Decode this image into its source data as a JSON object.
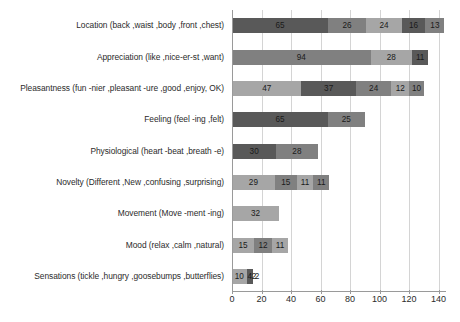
{
  "chart_data": {
    "type": "bar",
    "orientation": "horizontal",
    "stacked": true,
    "title": "",
    "xlabel": "",
    "ylabel": "",
    "xlim": [
      0,
      145
    ],
    "xticks": [
      0,
      20,
      40,
      60,
      80,
      100,
      120,
      140
    ],
    "xtick_labels": [
      "0",
      "20",
      "40",
      "60",
      "80",
      "100",
      "120",
      "140"
    ],
    "grid": true,
    "legend": "none",
    "categories": [
      "Location (back ,waist ,body ,front ,chest)",
      "Appreciation (like ,nice-er-st ,want)",
      "Pleasantness (fun -nier ,pleasant -ure ,good ,enjoy, OK)",
      "Feeling (feel -ing ,felt)",
      "Physiological (heart -beat ,breath -e)",
      "Novelty (Different ,New ,confusing ,surprising)",
      "Movement (Move -ment -ing)",
      "Mood (relax ,calm ,natural)",
      "Sensations (tickle ,hungry ,goosebumps ,butterflies)"
    ],
    "stacks": [
      [
        65,
        26,
        24,
        16,
        13
      ],
      [
        94,
        28,
        11
      ],
      [
        47,
        37,
        24,
        12,
        10
      ],
      [
        65,
        25
      ],
      [
        30,
        28
      ],
      [
        29,
        15,
        11,
        11
      ],
      [
        32
      ],
      [
        15,
        12,
        11
      ],
      [
        10,
        4,
        2,
        2
      ]
    ],
    "totals": [
      144,
      133,
      130,
      90,
      58,
      66,
      32,
      38,
      18
    ],
    "segment_colors": [
      [
        "#595959",
        "#808080",
        "#a6a6a6",
        "#595959",
        "#808080"
      ],
      [
        "#808080",
        "#a6a6a6",
        "#595959"
      ],
      [
        "#a6a6a6",
        "#595959",
        "#808080",
        "#a6a6a6",
        "#808080"
      ],
      [
        "#595959",
        "#808080"
      ],
      [
        "#595959",
        "#808080"
      ],
      [
        "#a6a6a6",
        "#808080",
        "#a6a6a6",
        "#808080"
      ],
      [
        "#a6a6a6"
      ],
      [
        "#a6a6a6",
        "#808080",
        "#a6a6a6"
      ],
      [
        "#a6a6a6",
        "#595959",
        "#ffffff",
        "#ffffff"
      ]
    ],
    "palette": {
      "dark_gray": "#595959",
      "medium_gray": "#808080",
      "light_gray": "#a6a6a6",
      "gridline": "#d4d4d4",
      "axis": "#9a9a9a",
      "background": "#ffffff",
      "label_text": "#2b2b2b"
    }
  }
}
